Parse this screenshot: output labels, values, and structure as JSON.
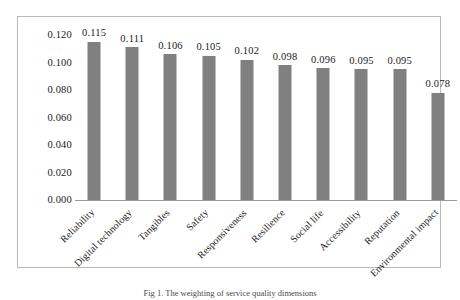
{
  "chart_data": {
    "type": "bar",
    "title": "",
    "xlabel": "",
    "ylabel": "",
    "ylim": [
      0,
      0.12
    ],
    "grid": false,
    "legend": false,
    "orientation": "vertical",
    "bar_color": "#808080",
    "frame_color": "#b9b9b9",
    "categories": [
      "Reliability",
      "Digital technology",
      "Tangibles",
      "Safety",
      "Responsiveness",
      "Resilience",
      "Social life",
      "Accessibility",
      "Reputation",
      "Environmental impact"
    ],
    "values": [
      0.115,
      0.111,
      0.106,
      0.105,
      0.102,
      0.098,
      0.096,
      0.095,
      0.095,
      0.078
    ],
    "value_labels": [
      "0.115",
      "0.111",
      "0.106",
      "0.105",
      "0.102",
      "0.098",
      "0.096",
      "0.095",
      "0.095",
      "0.078"
    ],
    "y_ticks": [
      0.0,
      0.02,
      0.04,
      0.06,
      0.08,
      0.1,
      0.12
    ],
    "y_tick_labels": [
      "0.000",
      "0.020",
      "0.040",
      "0.060",
      "0.080",
      "0.100",
      "0.120"
    ],
    "x_label_rotation_deg": -45
  },
  "caption": {
    "text": "Fig 1. The weighting of service quality dimensions"
  }
}
